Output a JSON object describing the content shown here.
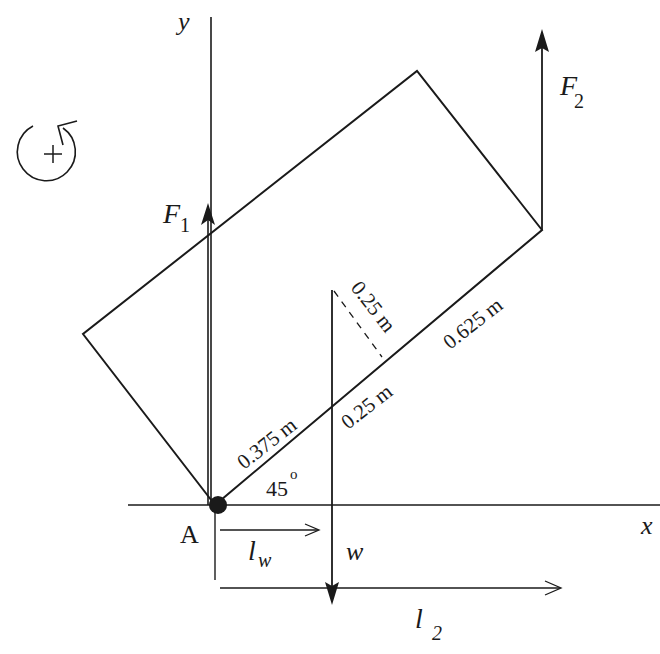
{
  "diagram": {
    "axes": {
      "x_label": "x",
      "y_label": "y"
    },
    "pivot": {
      "label": "A"
    },
    "rotation_sign": {
      "symbol": "+"
    },
    "forces": {
      "f1": {
        "label": "F",
        "subscript": "1"
      },
      "f2": {
        "label": "F",
        "subscript": "2"
      },
      "w": {
        "label": "w"
      }
    },
    "lever_arms": {
      "lw": {
        "label": "l",
        "subscript": "w"
      },
      "l2": {
        "label": "l",
        "subscript": "2"
      }
    },
    "dimensions": {
      "seg_a": "0.375 m",
      "seg_b": "0.25 m",
      "seg_c": "0.625 m",
      "perp": "0.25 m"
    },
    "angle": {
      "value": "45",
      "unit": "o"
    },
    "colors": {
      "stroke": "#1a1a1a",
      "background": "#ffffff"
    }
  }
}
